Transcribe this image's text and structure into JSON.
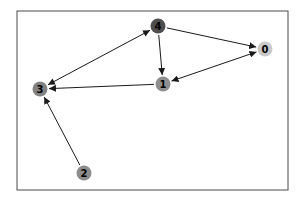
{
  "diagram": {
    "type": "directed-graph",
    "background_color": "#ffffff",
    "frame_color": "#4a4a4a",
    "edge_color": "#1a1a1a",
    "label_color": "#000000",
    "node_radius": 7.5,
    "nodes": [
      {
        "id": "0",
        "label": "0",
        "x": 265,
        "y": 49,
        "color": "#c9c9c9"
      },
      {
        "id": "1",
        "label": "1",
        "x": 163,
        "y": 84,
        "color": "#8f8f8f"
      },
      {
        "id": "2",
        "label": "2",
        "x": 84,
        "y": 173,
        "color": "#8c8c8c"
      },
      {
        "id": "3",
        "label": "3",
        "x": 40,
        "y": 89,
        "color": "#828282"
      },
      {
        "id": "4",
        "label": "4",
        "x": 158,
        "y": 26,
        "color": "#4e4e4e"
      }
    ],
    "edges": [
      {
        "from": "3",
        "to": "4",
        "bidirectional": true
      },
      {
        "from": "4",
        "to": "1",
        "bidirectional": false
      },
      {
        "from": "4",
        "to": "0",
        "bidirectional": false
      },
      {
        "from": "0",
        "to": "1",
        "bidirectional": true
      },
      {
        "from": "1",
        "to": "3",
        "bidirectional": false
      },
      {
        "from": "2",
        "to": "3",
        "bidirectional": false
      }
    ]
  }
}
